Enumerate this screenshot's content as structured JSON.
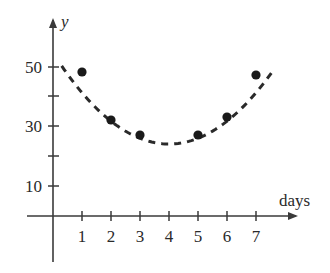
{
  "chart_data": {
    "type": "scatter",
    "title": "",
    "xlabel": "days",
    "ylabel": "y",
    "x_ticks": [
      1,
      2,
      3,
      4,
      5,
      6,
      7
    ],
    "x_tick_labels": [
      "1",
      "2",
      "3",
      "4",
      "5",
      "6",
      "7"
    ],
    "y_ticks": [
      10,
      20,
      30,
      40,
      50
    ],
    "y_tick_labels": [
      "10",
      "",
      "30",
      "",
      "50"
    ],
    "xlim": [
      -0.3,
      9
    ],
    "ylim": [
      -10,
      60
    ],
    "grid": false,
    "legend": null,
    "series": [
      {
        "name": "data points",
        "type": "scatter",
        "marker": "filled-circle",
        "x": [
          1,
          2,
          3,
          5,
          6,
          7
        ],
        "y": [
          48,
          32,
          27,
          27,
          33,
          47
        ]
      },
      {
        "name": "quadratic fit",
        "type": "line",
        "style": "dashed",
        "equation_approx": "y = 1.9*(x-4)^2 + 24",
        "x": [
          0.3,
          1,
          2,
          3,
          4,
          5,
          6,
          7,
          7.6
        ],
        "y": [
          60,
          48,
          31.6,
          25.9,
          24,
          25.9,
          31.6,
          41,
          48.6
        ]
      }
    ],
    "colors": {
      "axis": "#3a3a3a",
      "points": "#1a1a1a",
      "curve": "#2a2a2a"
    }
  },
  "axes": {
    "x_label": "days",
    "y_label": "y",
    "x_tick_labels": [
      "1",
      "2",
      "3",
      "4",
      "5",
      "6",
      "7"
    ],
    "y_tick_labels": {
      "t10": "10",
      "t30": "30",
      "t50": "50"
    }
  }
}
